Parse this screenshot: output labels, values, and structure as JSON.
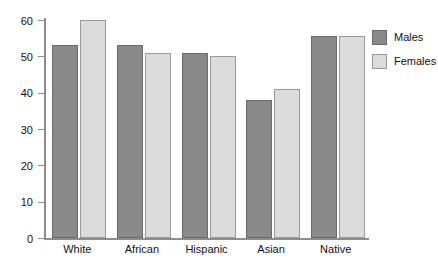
{
  "chart_data": {
    "type": "bar",
    "title": "",
    "subtitle": "",
    "xlabel": "",
    "ylabel": "",
    "categories": [
      "White",
      "African",
      "Hispanic",
      "Asian",
      "Native"
    ],
    "series": [
      {
        "name": "Males",
        "color": "#8a8a8a",
        "values": [
          53,
          53,
          51,
          38,
          55.5
        ]
      },
      {
        "name": "Females",
        "color": "#dcdcdc",
        "values": [
          60,
          51,
          50,
          41,
          55.5
        ]
      }
    ],
    "ylim": [
      0,
      60
    ],
    "yticks": [
      0,
      10,
      20,
      30,
      40,
      50,
      60
    ],
    "ytick_labels": [
      "0",
      "10",
      "20",
      "30",
      "40",
      "50",
      "60"
    ],
    "grid": false,
    "legend_position": "right-top",
    "legend_entries": [
      "Males",
      "Females"
    ],
    "axis_color": "#8d8d8d",
    "background": "#ffffff"
  }
}
